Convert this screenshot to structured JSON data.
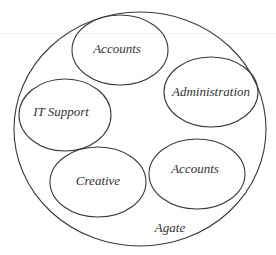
{
  "diagram": {
    "type": "nested-containment",
    "container": {
      "label": "Agate",
      "shape": "ellipse"
    },
    "groups": [
      {
        "id": "accounts-top",
        "label": "Accounts"
      },
      {
        "id": "administration",
        "label": "Administration"
      },
      {
        "id": "it-support",
        "label": "IT Support"
      },
      {
        "id": "creative",
        "label": "Creative"
      },
      {
        "id": "accounts-bottom",
        "label": "Accounts"
      }
    ],
    "colors": {
      "stroke": "#3a3a3a",
      "text": "#333333",
      "background": "#ffffff"
    }
  }
}
